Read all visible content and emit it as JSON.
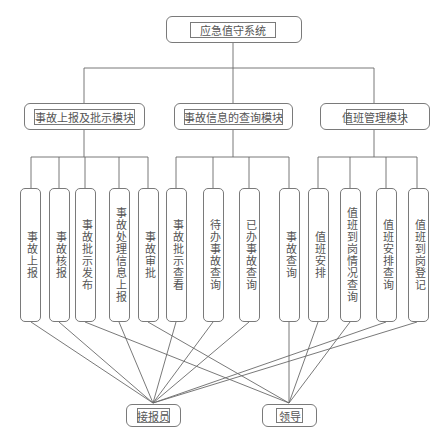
{
  "root": {
    "label": "应急值守系统"
  },
  "modules": [
    {
      "label": "事故上报及批示模块"
    },
    {
      "label": "事故信息的查询模块"
    },
    {
      "label": "值班管理模块"
    }
  ],
  "leaves": [
    {
      "label": "事故上报",
      "module": 0,
      "actor": "接报员"
    },
    {
      "label": "事故核报",
      "module": 0,
      "actor": "接报员"
    },
    {
      "label": "事故批示发布",
      "module": 0,
      "actor": "领导"
    },
    {
      "label": "事故处理信息上报",
      "module": 0,
      "actor": "接报员"
    },
    {
      "label": "事故审批",
      "module": 0,
      "actor": "领导"
    },
    {
      "label": "事故批示查看",
      "module": 1,
      "actor": "接报员"
    },
    {
      "label": "待办事故查询",
      "module": 1,
      "actor": "接报员"
    },
    {
      "label": "已办事故查询",
      "module": 1,
      "actor": "接报员"
    },
    {
      "label": "事故查询",
      "module": 1,
      "actor": "领导"
    },
    {
      "label": "值班安排",
      "module": 2,
      "actor": "领导"
    },
    {
      "label": "值班到岗情况查询",
      "module": 2,
      "actor": "领导"
    },
    {
      "label": "值班安排查询",
      "module": 2,
      "actor": "接报员"
    },
    {
      "label": "值班到岗登记",
      "module": 2,
      "actor": "接报员"
    }
  ],
  "actors": [
    {
      "label": "接报员"
    },
    {
      "label": "领导"
    }
  ]
}
